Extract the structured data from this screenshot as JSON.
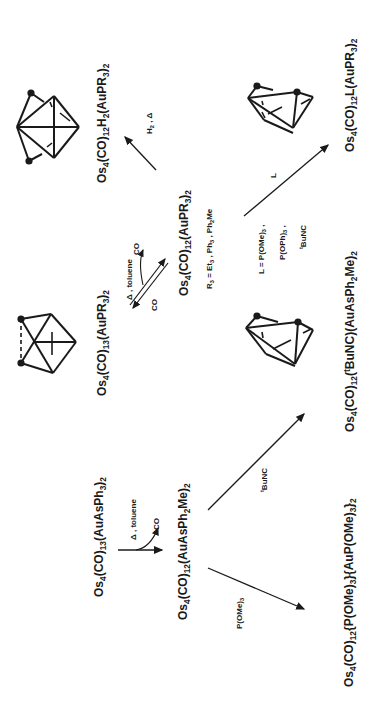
{
  "scheme": {
    "compounds": {
      "start": {
        "label": "Os4(CO)13(AuAsPh3)2",
        "base": "Os",
        "parts": [
          "4",
          "(CO)",
          "13",
          "(AuAsPh",
          "3",
          ")",
          "2"
        ]
      },
      "intermediate": {
        "label": "Os4(CO)12(AuAsPh2Me)2"
      },
      "phosphite_product": {
        "label": "Os4(CO)12{P(OMe)3}{AuP(OMe)3}2"
      },
      "isocyanide_product": {
        "label": "Os4(CO)12(tBuNC)(AuAsPh2Me)2"
      },
      "co13_phosphine": {
        "label": "Os4(CO)13(AuPR3)2"
      },
      "co12_phosphine": {
        "label": "Os4(CO)12(AuPR3)2"
      },
      "dihydride_product": {
        "label": "Os4(CO)12H2(AuPR3)2"
      },
      "ligand_product": {
        "label": "Os4(CO)12L(AuPR3)2"
      }
    },
    "conditions": {
      "delta_toluene_1": "Δ , toluene",
      "co_loss_1": "CO",
      "p_ome3": "P(OMe)3",
      "tbunc": "tBuNC",
      "delta_toluene_2": "Δ , toluene",
      "co_top": "CO",
      "co_bottom": "CO",
      "r3_definition": "R3 = Et3 , Ph3 , Ph2Me",
      "h2_delta": "H2 , Δ",
      "l_arrow": "L",
      "l_definition_line1": "L = P(OMe)3 ,",
      "l_definition_line2": "P(OPh)3 ,",
      "l_definition_line3": "tBuNC"
    },
    "structures": [
      {
        "name": "octahedral-dihydride-cluster",
        "gold_atoms": 2
      },
      {
        "name": "butterfly-co13-cluster",
        "gold_atoms": 2,
        "dashed_bond": true
      },
      {
        "name": "tetrahedral-ligand-cluster",
        "gold_atoms": 2
      },
      {
        "name": "tetrahedral-isocyanide-cluster",
        "gold_atoms": 2
      }
    ],
    "colors": {
      "ink": "#1a1a1a",
      "background": "#ffffff"
    }
  }
}
